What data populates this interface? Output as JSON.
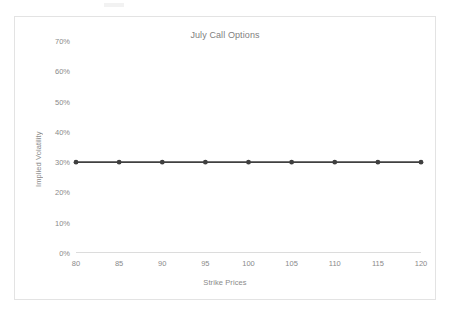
{
  "chart_data": {
    "type": "line",
    "title": "July Call Options",
    "xlabel": "Strike Prices",
    "ylabel": "Implied Volatility",
    "categories": [
      "80",
      "85",
      "90",
      "95",
      "100",
      "105",
      "110",
      "115",
      "120"
    ],
    "series": [
      {
        "name": "Implied Volatility",
        "values": [
          0.3,
          0.3,
          0.3,
          0.3,
          0.3,
          0.3,
          0.3,
          0.3,
          0.3
        ]
      }
    ],
    "y_tick_labels": [
      "0%",
      "10%",
      "20%",
      "30%",
      "40%",
      "50%",
      "60%",
      "70%"
    ],
    "y_tick_values": [
      0,
      0.1,
      0.2,
      0.3,
      0.4,
      0.5,
      0.6,
      0.7
    ],
    "ylim": [
      0,
      0.7
    ],
    "grid": false,
    "legend": false,
    "legend_position": "none",
    "colors": {
      "series_line": "#404040",
      "series_marker": "#3f3f3f",
      "axis_line": "#dcdcdc",
      "tick_label": "#8a8a8a",
      "title_text": "#808080",
      "frame_border": "#e3e3e3",
      "background": "#ffffff"
    }
  }
}
